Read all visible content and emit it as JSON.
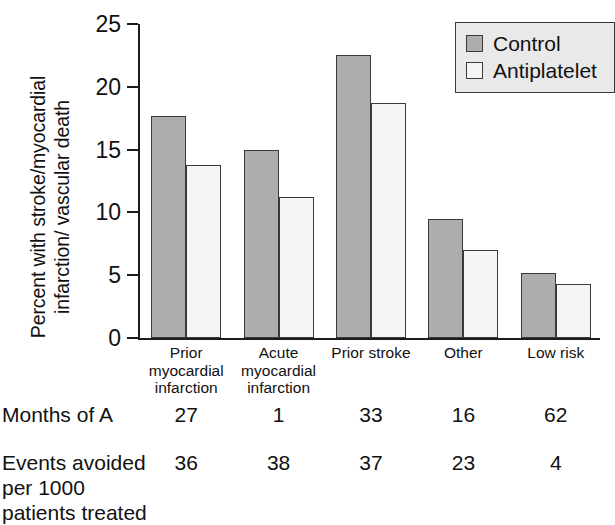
{
  "chart_data": {
    "type": "bar",
    "title": "",
    "xlabel": "",
    "ylabel": "Percent with stroke/myocardial infarction/ vascular death",
    "ylabel_lines": [
      "Percent with stroke/myocardial",
      "infarction/ vascular death"
    ],
    "ylim": [
      0,
      25
    ],
    "yticks": [
      0,
      5,
      10,
      15,
      20,
      25
    ],
    "ytick_labels": [
      "0",
      "5",
      "10",
      "15",
      "20",
      "25"
    ],
    "grid": false,
    "legend_position": "top-right",
    "categories": [
      "Prior myocardial infarction",
      "Acute myocardial infarction",
      "Prior stroke",
      "Other",
      "Low risk"
    ],
    "category_label_lines": [
      [
        "Prior",
        "myocardial",
        "infarction"
      ],
      [
        "Acute",
        "myocardial",
        "infarction"
      ],
      [
        "Prior stroke"
      ],
      [
        "Other"
      ],
      [
        "Low risk"
      ]
    ],
    "series": [
      {
        "name": "Control",
        "color": "#adadad",
        "values": [
          17.7,
          15.0,
          22.5,
          9.5,
          5.2
        ]
      },
      {
        "name": "Antiplatelet",
        "color": "#f5f5f5",
        "values": [
          13.8,
          11.2,
          18.7,
          7.0,
          4.3
        ]
      }
    ]
  },
  "legend": {
    "items": [
      {
        "label": "Control",
        "color": "#adadad"
      },
      {
        "label": "Antiplatelet",
        "color": "#f5f5f5"
      }
    ]
  },
  "table": {
    "rows": [
      {
        "label_lines": [
          "Months of A"
        ],
        "values": [
          "27",
          "1",
          "33",
          "16",
          "62"
        ]
      },
      {
        "label_lines": [
          "Events avoided",
          "per 1000",
          "patients treated"
        ],
        "values": [
          "36",
          "38",
          "37",
          "23",
          "4"
        ]
      }
    ]
  },
  "colors": {
    "control_fill": "#adadad",
    "antiplatelet_fill": "#f5f5f5",
    "bar_stroke": "#3a3a3a",
    "axis": "#1c1c1c",
    "legend_background": "#e9e9e9",
    "text": "#111111"
  }
}
